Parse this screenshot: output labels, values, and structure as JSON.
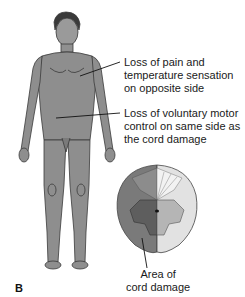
{
  "figure": {
    "panel_letter": "B",
    "annotations": [
      {
        "id": "pain-temp",
        "lines": [
          "Loss of pain and",
          "temperature sensation",
          "on opposite side"
        ]
      },
      {
        "id": "motor",
        "lines": [
          "Loss of voluntary motor",
          "control on same side as",
          "the cord damage"
        ]
      },
      {
        "id": "damage",
        "lines": [
          "Area of",
          "cord damage"
        ]
      }
    ],
    "colors": {
      "body_fill": "#8a8a8a",
      "body_outline": "#3a3a3a",
      "cord_damaged_side": "#7a7a7a",
      "cord_healthy_side": "#e2e2e2",
      "gray_matter_damaged": "#5e5e5e",
      "gray_matter_healthy": "#b5b5b5",
      "leader_line": "#111111"
    }
  }
}
